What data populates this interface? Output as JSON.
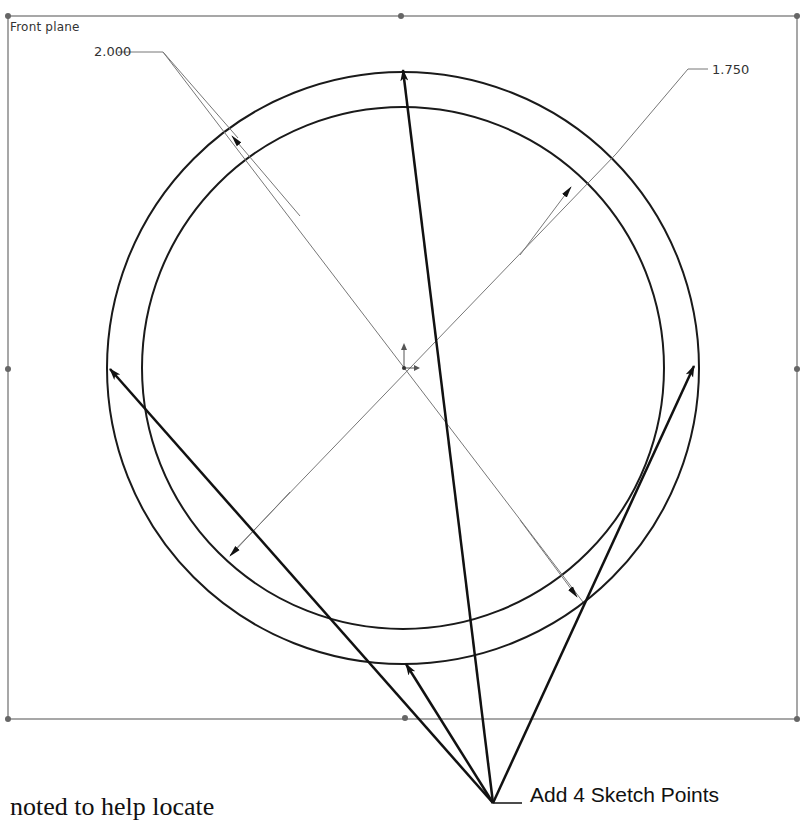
{
  "sketch": {
    "plane_label": "Front plane",
    "dimensions": [
      {
        "id": "outer-diameter",
        "value": "2.000"
      },
      {
        "id": "inner-diameter",
        "value": "1.750"
      }
    ],
    "circles": {
      "center": [
        403,
        368
      ],
      "outer_radius": 297,
      "inner_radius": 261
    },
    "frame": {
      "left": 8,
      "top": 16,
      "right": 797,
      "bottom": 719
    },
    "colors": {
      "frame": "#8a8a8a",
      "geometry": "#1a1a1a",
      "dimension": "#666666",
      "callout": "#111111"
    }
  },
  "annotation": {
    "callout_text": "Add 4 Sketch Points",
    "point_count": 4
  },
  "page_text": {
    "fragment": "noted to help locate"
  }
}
